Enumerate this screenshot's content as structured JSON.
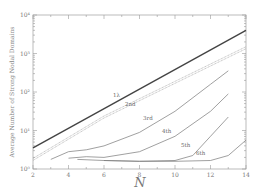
{
  "chart_data": {
    "type": "line",
    "title": "",
    "xlabel": "N",
    "ylabel": "Average Number of Strong Nodal Domains",
    "xlim": [
      2,
      14
    ],
    "ylim_log10": [
      0,
      4
    ],
    "yscale": "log",
    "x_ticks": [
      2,
      4,
      6,
      8,
      10,
      12,
      14
    ],
    "y_ticks": [
      "10^0",
      "10^1",
      "10^2",
      "10^3",
      "10^4"
    ],
    "grid": false,
    "legend": "inline labels",
    "series": [
      {
        "name": "1λ",
        "style": "thick-solid",
        "x": [
          2,
          14
        ],
        "log10y": [
          0.55,
          3.6
        ]
      },
      {
        "name": "2nd",
        "style": "double-dotted",
        "x": [
          2,
          4,
          6,
          14
        ],
        "log10y": [
          0.25,
          0.8,
          1.35,
          3.15
        ]
      },
      {
        "name": "3rd",
        "style": "solid",
        "x": [
          3,
          4,
          5,
          6,
          8,
          10,
          12,
          13
        ],
        "log10y": [
          0.25,
          0.45,
          0.5,
          0.6,
          0.95,
          1.5,
          2.2,
          2.55
        ]
      },
      {
        "name": "4th",
        "style": "solid",
        "x": [
          4,
          5,
          6,
          8,
          10,
          12,
          13
        ],
        "log10y": [
          0.28,
          0.32,
          0.3,
          0.45,
          0.85,
          1.5,
          1.95
        ]
      },
      {
        "name": "5th",
        "style": "solid",
        "x": [
          4.5,
          6,
          8,
          10,
          11,
          12,
          13
        ],
        "log10y": [
          0.25,
          0.22,
          0.2,
          0.22,
          0.35,
          0.85,
          1.35
        ]
      },
      {
        "name": "6th",
        "style": "solid",
        "x": [
          6,
          8,
          10,
          12,
          13,
          14
        ],
        "log10y": [
          0.22,
          0.2,
          0.2,
          0.22,
          0.35,
          0.75
        ]
      }
    ],
    "labels": [
      {
        "text": "1λ",
        "x": 7.3,
        "log10y": 1.95
      },
      {
        "text": "2nd",
        "x": 8.2,
        "log10y": 1.9
      },
      {
        "text": "3rd",
        "x": 9.2,
        "log10y": 1.45
      },
      {
        "text": "4th",
        "x": 10.3,
        "log10y": 0.95
      },
      {
        "text": "5th",
        "x": 11.5,
        "log10y": 0.45
      },
      {
        "text": "6th",
        "x": 12.4,
        "log10y": 0.25
      }
    ]
  },
  "axes": {
    "x_tick_labels": [
      "2",
      "4",
      "6",
      "8",
      "10",
      "12",
      "14"
    ],
    "y_tick_labels": [
      "10⁰",
      "10¹",
      "10²",
      "10³",
      "10⁴"
    ],
    "xlabel": "N",
    "ylabel": "Average Number of Strong Nodal Domains"
  },
  "labels": [
    "1λ",
    "2nd",
    "3rd",
    "4th",
    "5th",
    "6th"
  ]
}
